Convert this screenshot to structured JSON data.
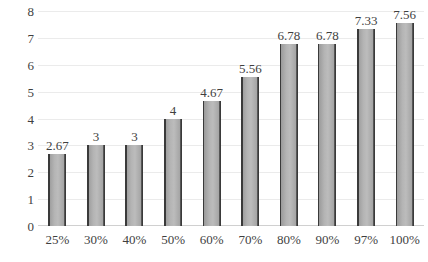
{
  "chart_data": {
    "type": "bar",
    "title": "",
    "subtitle": "",
    "xlabel": "",
    "ylabel": "",
    "categories": [
      "25%",
      "30%",
      "40%",
      "50%",
      "60%",
      "70%",
      "80%",
      "90%",
      "97%",
      "100%"
    ],
    "values": [
      2.67,
      3,
      3,
      4,
      4.67,
      5.56,
      6.78,
      6.78,
      7.33,
      7.56
    ],
    "data_labels": [
      "2.67",
      "3",
      "3",
      "4",
      "4.67",
      "5.56",
      "6.78",
      "6.78",
      "7.33",
      "7.56"
    ],
    "ylim": [
      0,
      8
    ],
    "ytick_labels": [
      "0",
      "1",
      "2",
      "3",
      "4",
      "5",
      "6",
      "7",
      "8"
    ],
    "ytick_values": [
      0,
      1,
      2,
      3,
      4,
      5,
      6,
      7,
      8
    ],
    "grid": true,
    "grid_axis": "y",
    "legend": false,
    "legend_position": "none",
    "series": [
      {
        "name": "Series 1",
        "values": [
          2.67,
          3,
          3,
          4,
          4.67,
          5.56,
          6.78,
          6.78,
          7.33,
          7.56
        ]
      }
    ],
    "colors": {
      "bar_face": "#b4b4b4",
      "bar_edge": "#3a3a3a",
      "gridline": "#ebebeb",
      "axis": "#d0d0d0",
      "text": "#3f3f3f",
      "background": "#ffffff"
    }
  }
}
